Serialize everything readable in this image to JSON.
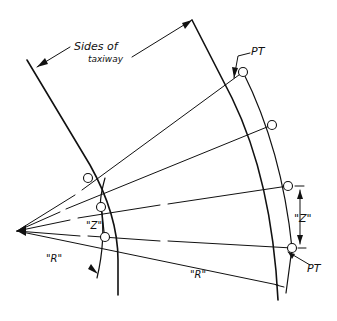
{
  "diagram": {
    "type": "taxiway curve fillet geometry",
    "labels": {
      "sides": "Sides of",
      "taxiway": "taxiway",
      "pt_top": "PT",
      "pt_bottom": "PT",
      "z_outer": "\"Z\"",
      "z_inner": "\"Z\"",
      "r_inner": "\"R\"",
      "r_outer": "\"R\""
    },
    "colors": {
      "stroke": "#111111",
      "background": "#ffffff"
    }
  }
}
